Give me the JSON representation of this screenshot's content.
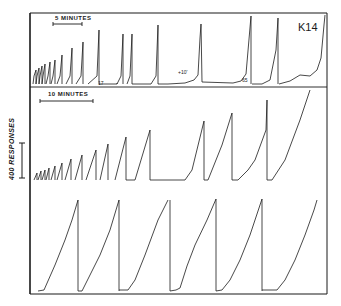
{
  "chart_data": {
    "type": "line",
    "title": "K14",
    "subject_label": "K14",
    "ylabel": "400 RESPONSES",
    "ink_color": "#1a1a1a",
    "panels": [
      {
        "name": "top",
        "time_scale_label": "5 MINUTES",
        "annotations": [
          "17",
          "+10'",
          "65"
        ],
        "description": "Cumulative record with reset pen excursions; early short ramps growing in height",
        "segments": [
          {
            "x0": 0.01,
            "x1": 0.014,
            "peak": 0.2
          },
          {
            "x0": 0.018,
            "x1": 0.024,
            "peak": 0.25
          },
          {
            "x0": 0.028,
            "x1": 0.036,
            "peak": 0.3
          },
          {
            "x0": 0.04,
            "x1": 0.05,
            "peak": 0.34
          },
          {
            "x0": 0.056,
            "x1": 0.07,
            "peak": 0.4
          },
          {
            "x0": 0.08,
            "x1": 0.1,
            "peak": 0.46
          },
          {
            "x0": 0.115,
            "x1": 0.14,
            "peak": 0.58
          },
          {
            "x0": 0.155,
            "x1": 0.185,
            "peak": 0.7
          },
          {
            "x0": 0.195,
            "x1": 0.235,
            "peak": 0.88
          },
          {
            "x0": 0.265,
            "x1": 0.285,
            "peak": 0.75
          },
          {
            "x0": 0.29,
            "x1": 0.31,
            "peak": 0.75
          },
          {
            "x0": 0.35,
            "x1": 0.375,
            "peak": 0.88
          },
          {
            "x0": 0.42,
            "x1": 0.45,
            "peak": 0.5
          },
          {
            "x0": 0.2,
            "x1": 0.2,
            "peak": 0.0
          }
        ]
      },
      {
        "name": "middle",
        "time_scale_label": "10 MINUTES",
        "annotations": [],
        "segments": []
      },
      {
        "name": "bottom",
        "time_scale_label": "",
        "annotations": [],
        "segments": []
      }
    ]
  }
}
